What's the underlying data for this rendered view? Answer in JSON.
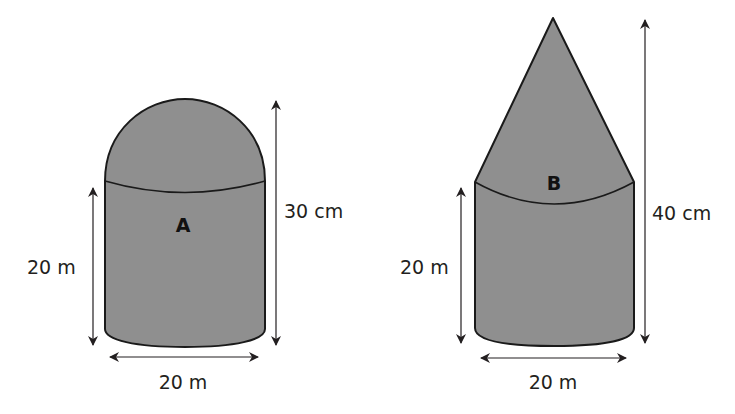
{
  "colors": {
    "fill": "#8f8f8f",
    "stroke": "#1a1a1a",
    "arrow": "#231f20",
    "text": "#231f20"
  },
  "shapes": [
    {
      "id": "A",
      "label": "A",
      "top_type": "dome",
      "cylinder_height_label": "20 m",
      "total_height_label": "30 cm",
      "width_label": "20 m"
    },
    {
      "id": "B",
      "label": "B",
      "top_type": "cone",
      "cylinder_height_label": "20 m",
      "total_height_label": "40 cm",
      "width_label": "20 m"
    }
  ]
}
